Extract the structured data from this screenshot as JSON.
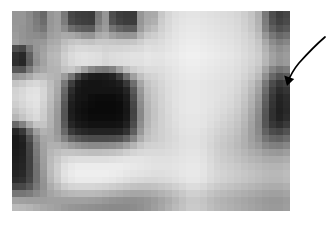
{
  "figure": {
    "caption": "",
    "image": {
      "name": "pixelated-grayscale-bullseye-image",
      "alt_text": "Pixelated grayscale image with dark circular ring structure at center",
      "grid_columns": 40,
      "grid_rows": 29,
      "block_size_px": 7,
      "frame": {
        "x": 12,
        "y": 11,
        "width": 278,
        "height": 200
      },
      "palette": {
        "darkest": "#0a0a0a",
        "dark": "#3a3a3a",
        "mid_dark": "#6e6e6e",
        "mid": "#9a9a9a",
        "mid_light": "#bdbdbd",
        "light": "#d8d8d8",
        "lightest": "#f2f2f2"
      },
      "pixels": [
        [
          150,
          150,
          138,
          120,
          104,
          150,
          158,
          120,
          70,
          62,
          60,
          58,
          120,
          150,
          78,
          62,
          58,
          58,
          150,
          168,
          170,
          200,
          214,
          222,
          226,
          228,
          228,
          226,
          224,
          222,
          220,
          218,
          214,
          206,
          196,
          176,
          120,
          78,
          62,
          70
        ],
        [
          150,
          150,
          140,
          124,
          108,
          150,
          158,
          124,
          74,
          66,
          62,
          60,
          124,
          150,
          82,
          66,
          60,
          60,
          150,
          170,
          176,
          204,
          216,
          224,
          228,
          230,
          230,
          228,
          226,
          224,
          222,
          220,
          216,
          208,
          198,
          178,
          124,
          82,
          66,
          74
        ],
        [
          152,
          148,
          140,
          128,
          118,
          152,
          160,
          140,
          110,
          98,
          92,
          90,
          140,
          156,
          116,
          100,
          92,
          92,
          156,
          180,
          190,
          208,
          218,
          226,
          230,
          232,
          232,
          230,
          228,
          226,
          224,
          222,
          218,
          210,
          200,
          182,
          130,
          96,
          80,
          88
        ],
        [
          156,
          148,
          142,
          140,
          136,
          158,
          164,
          170,
          168,
          160,
          150,
          148,
          170,
          176,
          160,
          150,
          148,
          150,
          180,
          200,
          206,
          214,
          222,
          228,
          232,
          234,
          234,
          232,
          230,
          228,
          226,
          224,
          220,
          214,
          206,
          190,
          150,
          120,
          104,
          112
        ],
        [
          160,
          150,
          146,
          150,
          152,
          168,
          172,
          188,
          196,
          200,
          196,
          194,
          200,
          200,
          198,
          196,
          196,
          198,
          206,
          216,
          216,
          220,
          226,
          230,
          234,
          236,
          236,
          234,
          232,
          230,
          228,
          226,
          222,
          216,
          210,
          198,
          168,
          140,
          126,
          134
        ],
        [
          78,
          70,
          118,
          150,
          160,
          176,
          180,
          198,
          210,
          216,
          216,
          214,
          214,
          210,
          212,
          212,
          214,
          216,
          218,
          224,
          222,
          224,
          228,
          232,
          236,
          238,
          238,
          236,
          234,
          232,
          230,
          228,
          224,
          218,
          212,
          202,
          178,
          154,
          142,
          150
        ],
        [
          48,
          40,
          96,
          146,
          164,
          182,
          186,
          206,
          218,
          224,
          226,
          224,
          222,
          216,
          220,
          222,
          224,
          226,
          226,
          230,
          228,
          228,
          232,
          234,
          238,
          240,
          240,
          238,
          236,
          234,
          232,
          230,
          226,
          220,
          214,
          206,
          184,
          162,
          150,
          156
        ],
        [
          46,
          38,
          92,
          142,
          162,
          180,
          184,
          204,
          216,
          222,
          224,
          222,
          220,
          214,
          218,
          220,
          222,
          224,
          224,
          228,
          226,
          226,
          230,
          232,
          236,
          238,
          238,
          236,
          234,
          232,
          230,
          228,
          224,
          218,
          212,
          204,
          182,
          160,
          148,
          154
        ],
        [
          86,
          84,
          124,
          158,
          168,
          178,
          180,
          194,
          200,
          186,
          160,
          136,
          124,
          120,
          130,
          160,
          190,
          206,
          214,
          220,
          220,
          222,
          226,
          230,
          234,
          236,
          236,
          234,
          232,
          230,
          228,
          226,
          222,
          216,
          208,
          196,
          164,
          132,
          116,
          124
        ],
        [
          150,
          156,
          170,
          186,
          188,
          182,
          178,
          156,
          118,
          70,
          40,
          28,
          26,
          28,
          34,
          60,
          110,
          160,
          192,
          208,
          212,
          218,
          224,
          228,
          232,
          234,
          234,
          232,
          230,
          228,
          226,
          224,
          220,
          212,
          202,
          186,
          144,
          104,
          84,
          92
        ],
        [
          196,
          202,
          212,
          216,
          208,
          190,
          172,
          120,
          62,
          30,
          22,
          20,
          20,
          22,
          24,
          30,
          56,
          110,
          166,
          196,
          206,
          214,
          222,
          226,
          230,
          232,
          232,
          230,
          228,
          226,
          224,
          222,
          216,
          206,
          192,
          170,
          120,
          76,
          56,
          64
        ],
        [
          210,
          216,
          224,
          226,
          214,
          192,
          168,
          104,
          44,
          24,
          20,
          20,
          20,
          20,
          20,
          22,
          36,
          88,
          152,
          190,
          202,
          212,
          220,
          226,
          230,
          232,
          232,
          230,
          228,
          226,
          224,
          220,
          214,
          202,
          186,
          162,
          108,
          64,
          44,
          52
        ],
        [
          212,
          218,
          226,
          228,
          214,
          190,
          164,
          96,
          36,
          22,
          20,
          14,
          12,
          12,
          12,
          16,
          28,
          78,
          146,
          186,
          200,
          210,
          220,
          226,
          230,
          232,
          232,
          230,
          228,
          226,
          222,
          218,
          210,
          198,
          180,
          154,
          98,
          56,
          36,
          44
        ],
        [
          206,
          214,
          222,
          226,
          210,
          186,
          158,
          88,
          30,
          20,
          16,
          12,
          10,
          10,
          10,
          12,
          24,
          70,
          140,
          182,
          198,
          210,
          218,
          226,
          230,
          232,
          232,
          230,
          228,
          224,
          220,
          216,
          208,
          194,
          176,
          148,
          92,
          52,
          34,
          42
        ],
        [
          196,
          206,
          216,
          222,
          206,
          182,
          154,
          84,
          28,
          18,
          14,
          10,
          10,
          10,
          10,
          12,
          22,
          66,
          136,
          180,
          196,
          208,
          218,
          224,
          230,
          232,
          232,
          230,
          226,
          222,
          218,
          212,
          204,
          190,
          170,
          142,
          86,
          48,
          32,
          40
        ],
        [
          182,
          196,
          210,
          218,
          204,
          180,
          152,
          84,
          30,
          20,
          16,
          12,
          12,
          12,
          12,
          14,
          24,
          68,
          136,
          180,
          196,
          208,
          216,
          224,
          228,
          230,
          230,
          228,
          224,
          220,
          214,
          208,
          200,
          186,
          166,
          138,
          84,
          48,
          34,
          44
        ],
        [
          104,
          130,
          170,
          196,
          196,
          178,
          152,
          90,
          38,
          26,
          22,
          18,
          18,
          18,
          18,
          20,
          32,
          76,
          142,
          182,
          198,
          208,
          216,
          222,
          228,
          230,
          230,
          228,
          222,
          216,
          210,
          204,
          196,
          182,
          162,
          136,
          86,
          56,
          46,
          58
        ],
        [
          38,
          56,
          110,
          158,
          178,
          172,
          152,
          104,
          58,
          44,
          38,
          34,
          34,
          34,
          34,
          36,
          50,
          94,
          152,
          188,
          200,
          208,
          214,
          220,
          226,
          228,
          228,
          224,
          218,
          212,
          206,
          200,
          192,
          178,
          160,
          138,
          98,
          76,
          70,
          82
        ],
        [
          26,
          34,
          80,
          136,
          166,
          170,
          158,
          130,
          100,
          88,
          80,
          76,
          76,
          76,
          78,
          82,
          100,
          132,
          172,
          194,
          202,
          208,
          214,
          218,
          224,
          226,
          226,
          222,
          216,
          208,
          202,
          196,
          188,
          176,
          160,
          144,
          116,
          102,
          98,
          108
        ],
        [
          26,
          30,
          68,
          126,
          162,
          176,
          176,
          168,
          156,
          148,
          142,
          138,
          138,
          140,
          142,
          148,
          162,
          180,
          198,
          208,
          210,
          212,
          216,
          220,
          224,
          226,
          226,
          222,
          214,
          206,
          200,
          194,
          186,
          176,
          164,
          154,
          136,
          128,
          126,
          134
        ],
        [
          28,
          32,
          66,
          122,
          160,
          182,
          190,
          196,
          196,
          194,
          192,
          190,
          190,
          192,
          194,
          198,
          206,
          212,
          216,
          218,
          218,
          218,
          220,
          222,
          226,
          228,
          228,
          224,
          216,
          208,
          202,
          196,
          190,
          182,
          174,
          168,
          158,
          154,
          152,
          158
        ],
        [
          30,
          34,
          64,
          118,
          158,
          186,
          200,
          214,
          220,
          222,
          222,
          222,
          222,
          222,
          224,
          226,
          228,
          228,
          228,
          226,
          224,
          224,
          224,
          226,
          228,
          230,
          230,
          226,
          218,
          210,
          204,
          200,
          194,
          188,
          182,
          178,
          172,
          170,
          170,
          174
        ],
        [
          32,
          36,
          64,
          114,
          156,
          188,
          206,
          224,
          232,
          236,
          236,
          236,
          236,
          236,
          236,
          236,
          234,
          232,
          230,
          228,
          226,
          226,
          226,
          228,
          230,
          232,
          232,
          228,
          220,
          212,
          208,
          204,
          200,
          194,
          190,
          186,
          182,
          180,
          180,
          184
        ],
        [
          36,
          40,
          66,
          112,
          152,
          186,
          206,
          226,
          234,
          238,
          238,
          238,
          238,
          238,
          236,
          234,
          230,
          228,
          226,
          224,
          222,
          222,
          224,
          226,
          230,
          232,
          232,
          228,
          220,
          214,
          210,
          206,
          202,
          198,
          194,
          190,
          186,
          184,
          184,
          188
        ],
        [
          44,
          48,
          70,
          112,
          148,
          182,
          202,
          222,
          230,
          234,
          234,
          234,
          234,
          232,
          230,
          226,
          222,
          218,
          216,
          214,
          214,
          216,
          218,
          222,
          226,
          230,
          230,
          226,
          218,
          212,
          208,
          204,
          200,
          196,
          192,
          188,
          184,
          182,
          182,
          186
        ],
        [
          70,
          72,
          88,
          120,
          146,
          172,
          188,
          204,
          212,
          214,
          214,
          214,
          212,
          210,
          206,
          202,
          198,
          194,
          192,
          192,
          194,
          198,
          202,
          208,
          214,
          220,
          220,
          216,
          208,
          202,
          198,
          194,
          190,
          186,
          182,
          178,
          174,
          172,
          172,
          176
        ],
        [
          118,
          118,
          124,
          138,
          150,
          164,
          172,
          180,
          184,
          186,
          186,
          186,
          184,
          180,
          176,
          172,
          168,
          166,
          166,
          168,
          172,
          178,
          184,
          192,
          200,
          208,
          208,
          204,
          196,
          190,
          186,
          182,
          178,
          174,
          170,
          166,
          162,
          160,
          160,
          164
        ],
        [
          162,
          160,
          158,
          158,
          158,
          160,
          160,
          160,
          160,
          160,
          160,
          158,
          156,
          152,
          148,
          146,
          144,
          144,
          146,
          150,
          156,
          164,
          172,
          182,
          192,
          200,
          200,
          196,
          188,
          182,
          178,
          174,
          170,
          166,
          162,
          158,
          154,
          152,
          152,
          156
        ],
        [
          186,
          184,
          180,
          174,
          168,
          164,
          160,
          154,
          150,
          148,
          146,
          144,
          142,
          140,
          138,
          138,
          138,
          140,
          144,
          150,
          158,
          166,
          176,
          186,
          194,
          202,
          202,
          198,
          190,
          184,
          180,
          176,
          172,
          168,
          164,
          160,
          156,
          154,
          154,
          158
        ]
      ]
    },
    "annotation": {
      "type": "curved-arrow",
      "label": "",
      "points_to": "image-right-region",
      "color": "#000000"
    }
  }
}
